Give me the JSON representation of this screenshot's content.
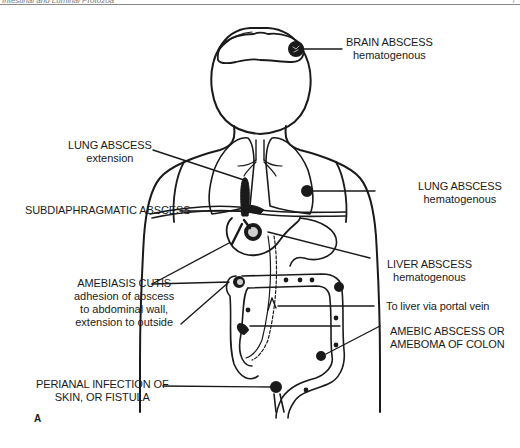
{
  "header": {
    "running_head": "Intestinal and Luminal Protozoa",
    "page_number": "7"
  },
  "figure": {
    "panel_letter": "A",
    "labels": [
      {
        "id": "brain",
        "title": "BRAIN ABSCESS",
        "lines": [
          "hematogenous"
        ]
      },
      {
        "id": "lung-extension",
        "title": "LUNG ABSCESS",
        "lines": [
          "extension"
        ]
      },
      {
        "id": "lung-hematogenous",
        "title": "LUNG ABSCESS",
        "lines": [
          "hematogenous"
        ]
      },
      {
        "id": "subdiaphragmatic",
        "title": "SUBDIAPHRAGMATIC ABSCESS",
        "lines": []
      },
      {
        "id": "liver",
        "title": "LIVER ABSCESS",
        "lines": [
          "hematogenous"
        ]
      },
      {
        "id": "cutis",
        "title": "AMEBIASIS CUTIS",
        "lines": [
          "adhesion of abscess",
          "to abdominal wall,",
          "extension to outside"
        ]
      },
      {
        "id": "portal",
        "title": "To liver via portal vein",
        "lines": []
      },
      {
        "id": "colon",
        "title": "AMEBIC ABSCESS OR",
        "lines": [
          "AMEBOMA OF COLON"
        ]
      },
      {
        "id": "perianal",
        "title": "PERIANAL INFECTION OF",
        "lines": [
          "SKIN, OR FISTULA"
        ]
      }
    ]
  },
  "colors": {
    "ink": "#1a1a1a",
    "background": "#ffffff",
    "rule": "#888888"
  }
}
